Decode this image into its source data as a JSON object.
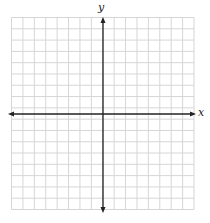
{
  "diagram": {
    "type": "coordinate-grid",
    "x_axis_label": "x",
    "y_axis_label": "y",
    "grid_columns": 16,
    "grid_rows": 17,
    "colors": {
      "grid": "#d4d4d4",
      "axis": "#222222",
      "background": "#ffffff"
    }
  }
}
